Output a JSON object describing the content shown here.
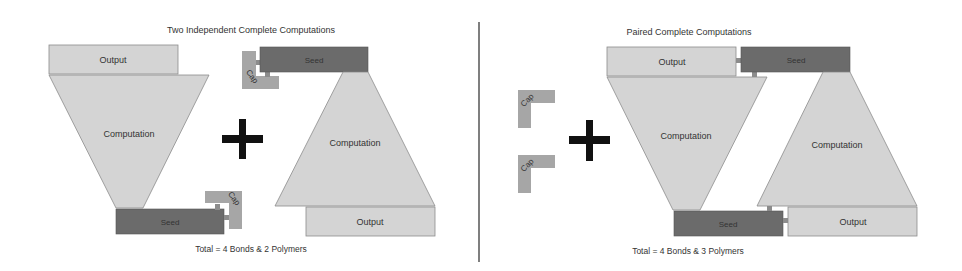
{
  "colors": {
    "light_block": "#d4d4d4",
    "light_border": "#8c8c8c",
    "seed": "#6b6b6b",
    "cap": "#a6a6a6",
    "plus": "#111111",
    "divider": "#555555",
    "text": "#333333"
  },
  "left_panel": {
    "title": "Two Independent Complete Computations",
    "total": "Total = 4 Bonds & 2 Polymers",
    "polymer_a": {
      "output": "Output",
      "computation": "Computation",
      "seed": "Seed",
      "cap": "Cap"
    },
    "polymer_b": {
      "output": "Output",
      "computation": "Computation",
      "seed": "Seed",
      "cap": "Cap"
    },
    "operator": "plus"
  },
  "right_panel": {
    "title": "Paired Complete Computations",
    "total": "Total = 4 Bonds & 3 Polymers",
    "free_caps": [
      "Cap",
      "Cap"
    ],
    "operator": "plus",
    "polymer_a": {
      "output": "Output",
      "computation": "Computation",
      "seed": "Seed"
    },
    "polymer_b": {
      "output": "Output",
      "computation": "Computation",
      "seed": "Seed"
    }
  }
}
